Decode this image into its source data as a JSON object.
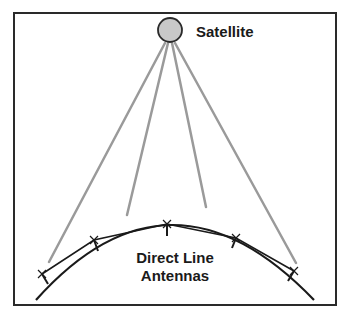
{
  "diagram": {
    "satellite_label": "Satellite",
    "antennas_label_line1": "Direct Line",
    "antennas_label_line2": "Antennas",
    "colors": {
      "frame": "#2a2a2a",
      "beam": "#9a9a9a",
      "satellite_fill": "#c8c8c8",
      "earth": "#1a1a1a"
    }
  }
}
